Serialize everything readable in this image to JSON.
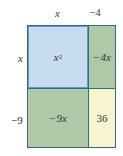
{
  "diagram": {
    "type": "area-model-multiplication",
    "top_labels": [
      "x",
      "-4"
    ],
    "side_labels": [
      "x",
      "-9"
    ],
    "cells": [
      {
        "row": 0,
        "col": 0,
        "label": "x",
        "exponent": "2",
        "color": "#c7dced"
      },
      {
        "row": 0,
        "col": 1,
        "label": "-4x",
        "color": "#aec9a5"
      },
      {
        "row": 1,
        "col": 0,
        "label": "-9x",
        "color": "#aec9a5"
      },
      {
        "row": 1,
        "col": 1,
        "label": "36",
        "color": "#f6f5cf"
      }
    ],
    "display": {
      "top_x": "x",
      "top_neg4": "−4",
      "side_x": "x",
      "side_neg9": "−9",
      "cell_x2_base": "x",
      "cell_x2_exp": "2",
      "cell_neg4x": "−4x",
      "cell_neg9x": "−9x",
      "cell_36": "36"
    },
    "border_color": "#2f6e78"
  }
}
